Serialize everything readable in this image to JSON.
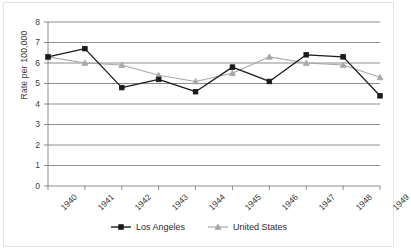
{
  "chart_data": {
    "type": "line",
    "title": "",
    "subtitle": "",
    "xlabel": "",
    "ylabel": "Rate per 100,000",
    "categories": [
      "1940",
      "1941",
      "1942",
      "1943",
      "1944",
      "1945",
      "1946",
      "1947",
      "1948",
      "1949"
    ],
    "x": [
      1940,
      1941,
      1942,
      1943,
      1944,
      1945,
      1946,
      1947,
      1948,
      1949
    ],
    "series": [
      {
        "name": "Los Angeles",
        "color": "#1a1a1a",
        "marker": "square",
        "values": [
          6.3,
          6.7,
          4.8,
          5.2,
          4.6,
          5.8,
          5.1,
          6.4,
          6.3,
          4.4
        ]
      },
      {
        "name": "United States",
        "color": "#a8a8a8",
        "marker": "triangle",
        "values": [
          6.3,
          6.0,
          5.9,
          5.4,
          5.1,
          5.5,
          6.3,
          6.0,
          5.9,
          5.3
        ]
      }
    ],
    "ylim": [
      0,
      8
    ],
    "yticks": [
      0,
      1,
      2,
      3,
      4,
      5,
      6,
      7,
      8
    ],
    "ytick_labels": [
      "0",
      "1",
      "2",
      "3",
      "4",
      "5",
      "6",
      "7",
      "8"
    ],
    "grid": true,
    "grid_axis": "y",
    "grid_color": "#808080",
    "legend_position": "bottom",
    "axis_color": "#808080",
    "plot_bg": "#ffffff"
  },
  "legend": {
    "items": [
      {
        "label": "Los Angeles"
      },
      {
        "label": "United States"
      }
    ]
  }
}
